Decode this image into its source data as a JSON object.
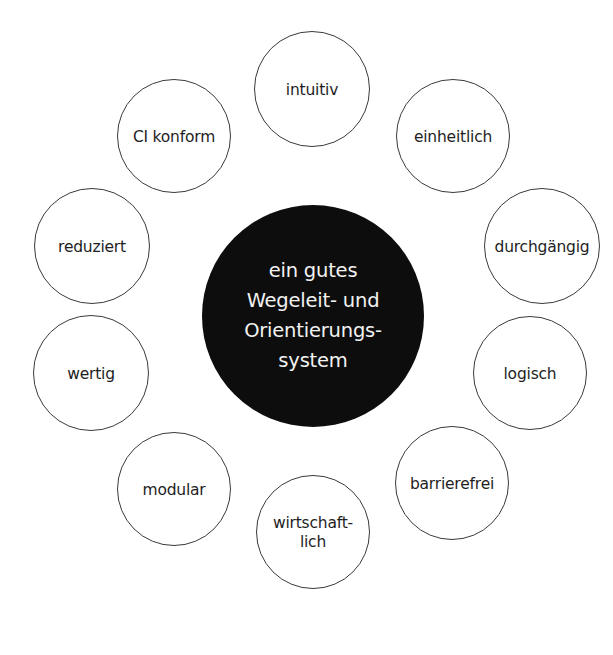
{
  "diagram": {
    "center": {
      "label": "ein gutes\nWegeleit- und\nOrientierungs-\nsystem",
      "cx": 313,
      "cy": 316,
      "r": 111,
      "fill": "#0d0d0d",
      "text_color": "#f2f2f2"
    },
    "nodes": [
      {
        "id": "intuitiv",
        "label": "intuitiv",
        "cx": 312,
        "cy": 89,
        "r": 58
      },
      {
        "id": "einheitlich",
        "label": "einheitlich",
        "cx": 453,
        "cy": 136,
        "r": 57
      },
      {
        "id": "durchgaengig",
        "label": "durchgängig",
        "cx": 542,
        "cy": 246,
        "r": 58
      },
      {
        "id": "logisch",
        "label": "logisch",
        "cx": 530,
        "cy": 373,
        "r": 57
      },
      {
        "id": "barrierefrei",
        "label": "barrierefrei",
        "cx": 452,
        "cy": 483,
        "r": 57
      },
      {
        "id": "wirtschaftlich",
        "label": "wirtschaft-\nlich",
        "cx": 313,
        "cy": 532,
        "r": 57
      },
      {
        "id": "modular",
        "label": "modular",
        "cx": 174,
        "cy": 489,
        "r": 57
      },
      {
        "id": "wertig",
        "label": "wertig",
        "cx": 91,
        "cy": 373,
        "r": 58
      },
      {
        "id": "reduziert",
        "label": "reduziert",
        "cx": 92,
        "cy": 246,
        "r": 58
      },
      {
        "id": "ci-konform",
        "label": "CI konform",
        "cx": 174,
        "cy": 136,
        "r": 57
      }
    ],
    "colors": {
      "background": "#ffffff",
      "node_stroke": "#3a3a3a",
      "node_text": "#1e1e1e"
    }
  }
}
